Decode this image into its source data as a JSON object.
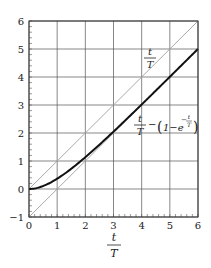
{
  "chart_data": {
    "type": "line",
    "title": "",
    "xlabel": "t/T",
    "ylabel": "",
    "xlim": [
      0,
      6
    ],
    "ylim": [
      -1,
      6
    ],
    "xticks": [
      0,
      1,
      2,
      3,
      4,
      5,
      6
    ],
    "yticks": [
      -1,
      0,
      1,
      2,
      3,
      4,
      5,
      6
    ],
    "grid": true,
    "series": [
      {
        "name": "t/T",
        "color": "#aaaaaa",
        "style": "thin",
        "x": [
          0,
          6
        ],
        "y": [
          0,
          6
        ]
      },
      {
        "name": "t/T - 1 (asymptote)",
        "color": "#aaaaaa",
        "style": "thin",
        "x": [
          0,
          6
        ],
        "y": [
          -1,
          5
        ]
      },
      {
        "name": "t/T - (1 - e^(-t/T))",
        "color": "#111111",
        "style": "thick",
        "x": [
          0,
          0.5,
          1,
          1.5,
          2,
          2.5,
          3,
          3.5,
          4,
          4.5,
          5,
          5.5,
          6
        ],
        "y": [
          0,
          0.107,
          0.368,
          0.723,
          1.135,
          1.582,
          2.05,
          2.53,
          3.018,
          3.511,
          4.007,
          4.504,
          5.002
        ]
      }
    ],
    "annotations": [
      {
        "text": "t/T",
        "at": [
          4.3,
          4.8
        ]
      },
      {
        "text": "t/T − (1 − e^(−t/T))",
        "at": [
          4.3,
          2.3
        ]
      }
    ]
  },
  "labels": {
    "x_axis_num": "t",
    "x_axis_den": "T",
    "ann1_num": "t",
    "ann1_den": "T",
    "ann2_num": "t",
    "ann2_den": "T",
    "ann2_minus": "−",
    "ann2_paren_open": "(",
    "ann2_one_minus_e": "1−e",
    "ann2_exp_minus": "−",
    "ann2_exp_num": "t",
    "ann2_exp_den": "T",
    "ann2_paren_close": ")"
  }
}
